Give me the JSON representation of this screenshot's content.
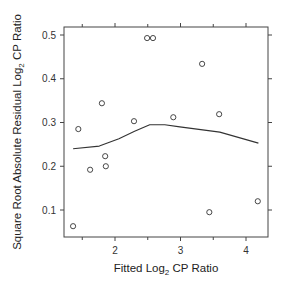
{
  "chart_data": {
    "type": "scatter",
    "title": "",
    "xlabel": "Fitted Log2 CP Ratio",
    "ylabel": "Square Root Absolute Residual Log2 CP Ratio",
    "xlabel_parts": {
      "pre": "Fitted Log",
      "sub": "2",
      "post": " CP Ratio"
    },
    "ylabel_parts": {
      "pre": "Square Root Absolute Residual Log",
      "sub": "2",
      "post": " CP Ratio"
    },
    "xlim": [
      1.25,
      4.35
    ],
    "ylim": [
      0.03,
      0.52
    ],
    "x_ticks": [
      2,
      3,
      4
    ],
    "x_tick_labels": [
      "2",
      "3",
      "4"
    ],
    "x_minor_ticks": [
      1.5,
      2.5,
      3.5
    ],
    "y_ticks": [
      0.1,
      0.2,
      0.3,
      0.4,
      0.5
    ],
    "y_tick_labels": [
      "0.1",
      "0.2",
      "0.3",
      "0.4",
      "0.5"
    ],
    "grid": false,
    "legend": null,
    "series": [
      {
        "name": "residuals",
        "type": "scatter",
        "marker": "open-circle",
        "x": [
          1.36,
          1.44,
          1.62,
          1.8,
          1.85,
          1.86,
          2.29,
          2.49,
          2.58,
          2.89,
          3.33,
          3.44,
          3.59,
          4.18
        ],
        "y": [
          0.063,
          0.285,
          0.192,
          0.344,
          0.223,
          0.2,
          0.303,
          0.493,
          0.493,
          0.312,
          0.434,
          0.095,
          0.319,
          0.12
        ]
      },
      {
        "name": "smooth",
        "type": "line",
        "x": [
          1.36,
          1.76,
          2.06,
          2.3,
          2.53,
          2.76,
          2.99,
          3.6,
          4.19
        ],
        "y": [
          0.24,
          0.246,
          0.263,
          0.28,
          0.295,
          0.295,
          0.29,
          0.278,
          0.253
        ]
      }
    ]
  }
}
